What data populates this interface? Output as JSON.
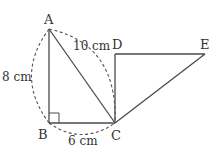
{
  "diagram": {
    "points": {
      "A": {
        "label": "A",
        "x": 49,
        "y": 29
      },
      "B": {
        "label": "B",
        "x": 49,
        "y": 123
      },
      "C": {
        "label": "C",
        "x": 115,
        "y": 123
      },
      "D": {
        "label": "D",
        "x": 115,
        "y": 54
      },
      "E": {
        "label": "E",
        "x": 205,
        "y": 54
      }
    },
    "segments": [
      "AB",
      "BC",
      "AC",
      "CD",
      "DE",
      "CE"
    ],
    "right_angle_at": "B",
    "measurements": {
      "AB": "8 cm",
      "BC": "6 cm",
      "AC": "10 cm"
    },
    "colors": {
      "stroke": "#4a4a4a",
      "text": "#333333",
      "background": "#ffffff"
    }
  }
}
